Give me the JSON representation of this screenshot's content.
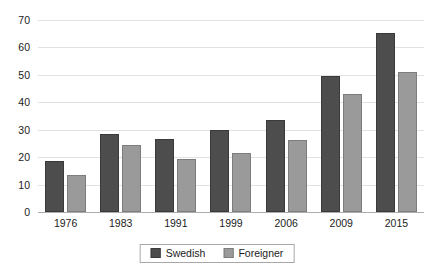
{
  "chart_data": {
    "type": "bar",
    "title": "",
    "subtitle": "",
    "xlabel": "",
    "ylabel": "",
    "categories": [
      "1976",
      "1983",
      "1991",
      "1999",
      "2006",
      "2009",
      "2015"
    ],
    "series": [
      {
        "name": "Swedish",
        "color": "#4d4d4d",
        "values": [
          18.7,
          28.3,
          26.8,
          30.0,
          33.5,
          49.5,
          65.2
        ]
      },
      {
        "name": "Foreigner",
        "color": "#9a9a9a",
        "values": [
          13.4,
          24.3,
          19.4,
          21.4,
          26.3,
          43.1,
          51.0
        ]
      }
    ],
    "ylim": [
      0,
      70
    ],
    "yticks": [
      0,
      10,
      20,
      30,
      40,
      50,
      60,
      70
    ],
    "ytick_labels": [
      "0",
      "10",
      "20",
      "30",
      "40",
      "50",
      "60",
      "70"
    ],
    "grid": true,
    "grid_axis": "y",
    "legend": true,
    "legend_position": "bottom",
    "legend_entries": [
      "Swedish",
      "Foreigner"
    ],
    "annotations": []
  }
}
